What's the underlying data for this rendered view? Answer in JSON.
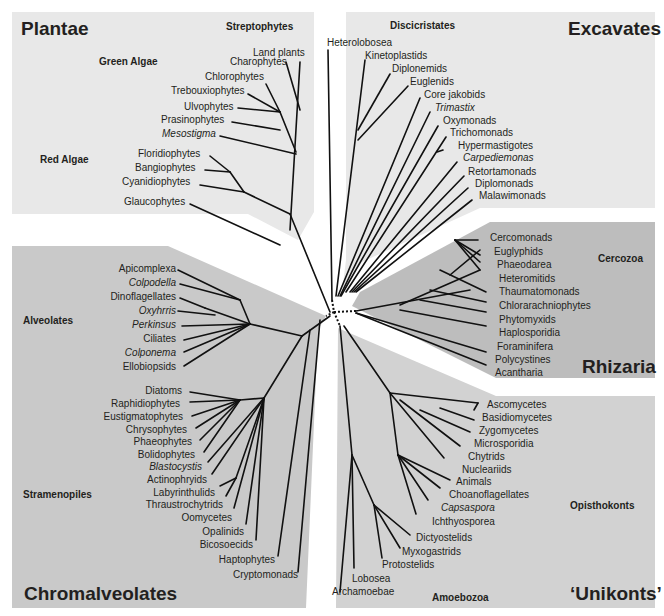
{
  "colors": {
    "plantae_panel": "#e8e8e8",
    "excavates_panel": "#e8e8e8",
    "rhizaria_panel": "#bdbdbd",
    "unikonts_panel": "#d2d2d2",
    "chromalveolates_panel": "#c9c9c9",
    "branch": "#111111"
  },
  "groups": {
    "plantae": "Plantae",
    "excavates": "Excavates",
    "rhizaria": "Rhizaria",
    "unikonts": "‘Unikonts’",
    "chromalveolates": "Chromalveolates"
  },
  "clades": {
    "streptophytes": "Streptophytes",
    "green_algae": "Green Algae",
    "red_algae": "Red Algae",
    "discicristates": "Discicristates",
    "cercozoa": "Cercozoa",
    "opisthokonts": "Opisthokonts",
    "amoebozoa": "Amoebozoa",
    "alveolates": "Alveolates",
    "stramenopiles": "Stramenopiles"
  },
  "taxa": {
    "plantae": [
      "Land plants",
      "Charophytes",
      "Chlorophytes",
      "Trebouxiophytes",
      "Ulvophytes",
      "Prasinophytes",
      "Mesostigma",
      "Floridiophytes",
      "Bangiophytes",
      "Cyanidiophytes",
      "Glaucophytes"
    ],
    "excavates": [
      "Heterolobosea",
      "Kinetoplastids",
      "Diplonemids",
      "Euglenids",
      "Core jakobids",
      "Trimastix",
      "Oxymonads",
      "Trichomonads",
      "Hypermastigotes",
      "Carpediemonas",
      "Retortamonads",
      "Diplomonads",
      "Malawimonads"
    ],
    "rhizaria": [
      "Cercomonads",
      "Euglyphids",
      "Phaeodarea",
      "Heteromitids",
      "Thaumatomonads",
      "Chlorarachniophytes",
      "Phytomyxids",
      "Haplosporidia",
      "Foraminifera",
      "Polycystines",
      "Acantharia"
    ],
    "unikonts": [
      "Ascomycetes",
      "Basidiomycetes",
      "Zygomycetes",
      "Microsporidia",
      "Chytrids",
      "Nucleariids",
      "Animals",
      "Choanoflagellates",
      "Capsaspora",
      "Ichthyosporea",
      "Dictyostelids",
      "Myxogastrids",
      "Protostelids",
      "Lobosea",
      "Archamoebae"
    ],
    "alveolates": [
      "Apicomplexa",
      "Colpodella",
      "Dinoflagellates",
      "Oxyhrris",
      "Perkinsus",
      "Ciliates",
      "Colponema",
      "Ellobiopsids"
    ],
    "stramenopiles": [
      "Diatoms",
      "Raphidiophytes",
      "Eustigmatophytes",
      "Chrysophytes",
      "Phaeophytes",
      "Bolidophytes",
      "Blastocystis",
      "Actinophryids",
      "Labyrinthulids",
      "Thraustrochytrids",
      "Oomycetes",
      "Opalinids",
      "Bicosoecids"
    ],
    "chromalveolates_other": [
      "Haptophytes",
      "Cryptomonads"
    ]
  }
}
